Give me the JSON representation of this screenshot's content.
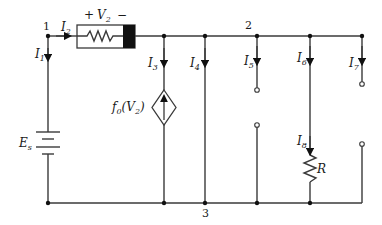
{
  "diagram": {
    "type": "circuit",
    "nodes": [
      {
        "id": "1",
        "label": "1"
      },
      {
        "id": "2",
        "label": "2"
      },
      {
        "id": "3",
        "label": "3"
      }
    ],
    "components": {
      "source": {
        "label": "E",
        "sub": "s"
      },
      "box_element": {
        "voltage_label": "V",
        "voltage_sub": "2",
        "plus": "+",
        "minus": "−"
      },
      "dependent_source": {
        "label_pre": "f",
        "label_sub": "0",
        "label_arg": "(V",
        "label_arg_sub": "2",
        "label_close": ")"
      },
      "resistor": {
        "label": "R"
      }
    },
    "currents": [
      {
        "name": "I",
        "sub": "1"
      },
      {
        "name": "I",
        "sub": "2"
      },
      {
        "name": "I",
        "sub": "3"
      },
      {
        "name": "I",
        "sub": "4"
      },
      {
        "name": "I",
        "sub": "5"
      },
      {
        "name": "I",
        "sub": "6"
      },
      {
        "name": "I",
        "sub": "7"
      },
      {
        "name": "I",
        "sub": "8"
      }
    ]
  }
}
